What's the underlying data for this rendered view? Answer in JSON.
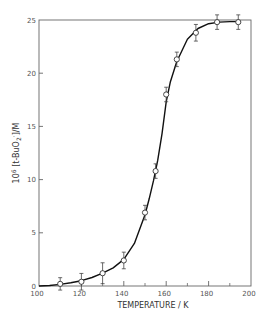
{
  "chart_data": {
    "type": "scatter",
    "title": "",
    "xlabel": "TEMPERATURE / K",
    "ylabel": "10^6 [t-BuO2·]/M",
    "ylabel_parts": {
      "prefix": "10",
      "exp": "6",
      "body": " [t-BuO",
      "sub": "2",
      "sup": "·",
      "suffix": "]/M"
    },
    "xlim": [
      100,
      200
    ],
    "ylim": [
      0,
      25
    ],
    "x_ticks_major": [
      100,
      120,
      140,
      160,
      180,
      200
    ],
    "x_ticks_minor": [
      110,
      130,
      150,
      170,
      190
    ],
    "x_tick_labels": [
      "100",
      "120",
      "140",
      "160",
      "180",
      "200"
    ],
    "y_ticks": [
      0,
      5,
      10,
      15,
      20,
      25
    ],
    "y_tick_labels": [
      "0",
      "5",
      "10",
      "15",
      "20",
      "25"
    ],
    "grid": false,
    "legend": null,
    "series": [
      {
        "name": "measured",
        "marker": "open-circle-with-error-bars",
        "x": [
          110,
          120,
          130,
          140,
          150,
          155,
          160,
          165,
          174,
          184,
          194
        ],
        "y": [
          0.2,
          0.4,
          1.2,
          2.4,
          6.9,
          10.8,
          18.0,
          21.3,
          23.8,
          24.8,
          24.8
        ],
        "err": [
          0.3,
          0.5,
          0.7,
          0.5,
          0.4,
          0.4,
          0.4,
          0.4,
          0.5,
          0.4,
          0.4
        ]
      },
      {
        "name": "fitted curve",
        "type": "line",
        "x": [
          100,
          105,
          110,
          115,
          120,
          125,
          130,
          135,
          140,
          145,
          150,
          152,
          154,
          156,
          158,
          160,
          162,
          165,
          170,
          175,
          180,
          185,
          190,
          195
        ],
        "y": [
          0.0,
          0.05,
          0.15,
          0.3,
          0.5,
          0.8,
          1.2,
          1.7,
          2.5,
          4.0,
          6.7,
          8.2,
          9.9,
          11.8,
          14.3,
          17.3,
          19.2,
          21.1,
          23.2,
          24.2,
          24.65,
          24.8,
          24.85,
          24.85
        ]
      }
    ]
  }
}
